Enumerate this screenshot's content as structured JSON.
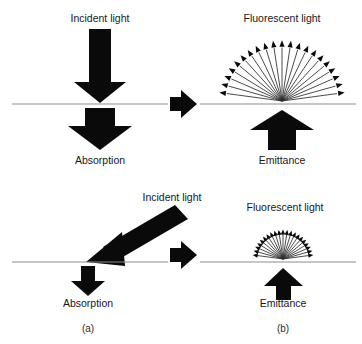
{
  "figure": {
    "title_visible": false,
    "background": "#ffffff",
    "ink_color": "#0a0a0a",
    "line_color": "#8b8b8b"
  },
  "panels": [
    {
      "id": "a",
      "caption": "(a)",
      "caption_x": 88,
      "caption_y": 330,
      "rows": [
        {
          "id": "a-top",
          "incident_label": "Incident light",
          "incident_label_x": 100,
          "incident_label_y": 22,
          "incident_geometry": "vertical-down",
          "absorption_label": "Absorption",
          "absorption_label_x": 100,
          "absorption_label_y": 160,
          "surface_y": 104,
          "surface_x1": 12,
          "surface_x2": 168
        },
        {
          "id": "a-bottom",
          "incident_label": "Incident light",
          "incident_label_x": 172,
          "incident_label_y": 201,
          "incident_geometry": "diagonal-down-left",
          "absorption_label": "Absorption",
          "absorption_label_x": 88,
          "absorption_label_y": 303,
          "surface_y": 262,
          "surface_x1": 12,
          "surface_x2": 168
        }
      ]
    },
    {
      "id": "b",
      "caption": "(b)",
      "caption_x": 283,
      "caption_y": 330,
      "rows": [
        {
          "id": "b-top",
          "fluorescent_label": "Fluorescent light",
          "fluorescent_label_x": 282,
          "fluorescent_label_y": 22,
          "emittance_label": "Emittance",
          "emittance_label_x": 282,
          "emittance_label_y": 160,
          "surface_y": 104,
          "surface_x1": 200,
          "surface_x2": 356,
          "fan_radius": 62,
          "fan_ray_count": 21,
          "fan_origin_x": 282,
          "fan_origin_y": 101
        },
        {
          "id": "b-bottom",
          "fluorescent_label": "Fluorescent light",
          "fluorescent_label_x": 285,
          "fluorescent_label_y": 211,
          "emittance_label": "Emittance",
          "emittance_label_x": 283,
          "emittance_label_y": 303,
          "surface_y": 262,
          "surface_x1": 200,
          "surface_x2": 356,
          "fan_radius": 30,
          "fan_ray_count": 21,
          "fan_origin_x": 283,
          "fan_origin_y": 259
        }
      ]
    }
  ],
  "connectors": [
    {
      "id": "connector-top",
      "x": 183,
      "y": 104,
      "direction": "right"
    },
    {
      "id": "connector-bottom",
      "x": 183,
      "y": 255,
      "direction": "right"
    }
  ]
}
